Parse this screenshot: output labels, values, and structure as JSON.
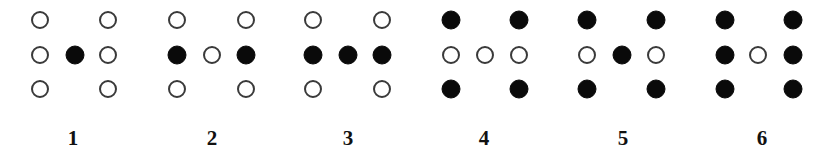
{
  "figure": {
    "row_y": [
      20,
      55,
      89
    ],
    "label_y": 145,
    "dot_radius": 9,
    "colors": {
      "filled": "#0a0a0a",
      "open_stroke": "#3a3a3a",
      "background": "#ffffff"
    },
    "panels": [
      {
        "label": "1",
        "label_x": 73,
        "col_x": [
          40,
          75,
          108
        ],
        "dots": [
          {
            "row": 0,
            "col": 0,
            "filled": false
          },
          {
            "row": 0,
            "col": 2,
            "filled": false
          },
          {
            "row": 1,
            "col": 0,
            "filled": false
          },
          {
            "row": 1,
            "col": 1,
            "filled": true
          },
          {
            "row": 1,
            "col": 2,
            "filled": false
          },
          {
            "row": 2,
            "col": 0,
            "filled": false
          },
          {
            "row": 2,
            "col": 2,
            "filled": false
          }
        ]
      },
      {
        "label": "2",
        "label_x": 212,
        "col_x": [
          177,
          212,
          246
        ],
        "dots": [
          {
            "row": 0,
            "col": 0,
            "filled": false
          },
          {
            "row": 0,
            "col": 2,
            "filled": false
          },
          {
            "row": 1,
            "col": 0,
            "filled": true
          },
          {
            "row": 1,
            "col": 1,
            "filled": false
          },
          {
            "row": 1,
            "col": 2,
            "filled": true
          },
          {
            "row": 2,
            "col": 0,
            "filled": false
          },
          {
            "row": 2,
            "col": 2,
            "filled": false
          }
        ]
      },
      {
        "label": "3",
        "label_x": 348,
        "col_x": [
          313,
          348,
          382
        ],
        "dots": [
          {
            "row": 0,
            "col": 0,
            "filled": false
          },
          {
            "row": 0,
            "col": 2,
            "filled": false
          },
          {
            "row": 1,
            "col": 0,
            "filled": true
          },
          {
            "row": 1,
            "col": 1,
            "filled": true
          },
          {
            "row": 1,
            "col": 2,
            "filled": true
          },
          {
            "row": 2,
            "col": 0,
            "filled": false
          },
          {
            "row": 2,
            "col": 2,
            "filled": false
          }
        ]
      },
      {
        "label": "4",
        "label_x": 484,
        "col_x": [
          451,
          485,
          519
        ],
        "dots": [
          {
            "row": 0,
            "col": 0,
            "filled": true
          },
          {
            "row": 0,
            "col": 2,
            "filled": true
          },
          {
            "row": 1,
            "col": 0,
            "filled": false
          },
          {
            "row": 1,
            "col": 1,
            "filled": false
          },
          {
            "row": 1,
            "col": 2,
            "filled": false
          },
          {
            "row": 2,
            "col": 0,
            "filled": true
          },
          {
            "row": 2,
            "col": 2,
            "filled": true
          }
        ]
      },
      {
        "label": "5",
        "label_x": 623,
        "col_x": [
          587,
          622,
          656
        ],
        "dots": [
          {
            "row": 0,
            "col": 0,
            "filled": true
          },
          {
            "row": 0,
            "col": 2,
            "filled": true
          },
          {
            "row": 1,
            "col": 0,
            "filled": false
          },
          {
            "row": 1,
            "col": 1,
            "filled": true
          },
          {
            "row": 1,
            "col": 2,
            "filled": false
          },
          {
            "row": 2,
            "col": 0,
            "filled": true
          },
          {
            "row": 2,
            "col": 2,
            "filled": true
          }
        ]
      },
      {
        "label": "6",
        "label_x": 762,
        "col_x": [
          725,
          758,
          793
        ],
        "dots": [
          {
            "row": 0,
            "col": 0,
            "filled": true
          },
          {
            "row": 0,
            "col": 2,
            "filled": true
          },
          {
            "row": 1,
            "col": 0,
            "filled": true
          },
          {
            "row": 1,
            "col": 1,
            "filled": false
          },
          {
            "row": 1,
            "col": 2,
            "filled": true
          },
          {
            "row": 2,
            "col": 0,
            "filled": true
          },
          {
            "row": 2,
            "col": 2,
            "filled": true
          }
        ]
      }
    ]
  }
}
